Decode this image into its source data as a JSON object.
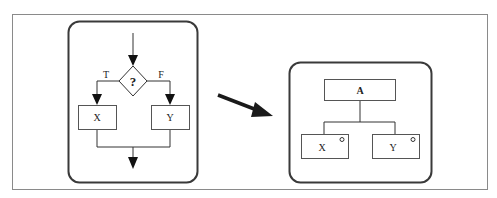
{
  "figure": {
    "colors": {
      "frame": "#8a8a8a",
      "panel_border": "#3a3a3a",
      "line": "#333333",
      "arrow": "#1a1a1a",
      "background": "#ffffff"
    },
    "left_panel": {
      "name": "flowchart",
      "decision_label": "?",
      "true_label": "T",
      "false_label": "F",
      "box_true_label": "X",
      "box_false_label": "Y"
    },
    "transform_arrow": "right-down-arrow",
    "right_panel": {
      "name": "structure-chart",
      "root_label": "A",
      "child_left_label": "X",
      "child_right_label": "Y",
      "child_marker": "selection-circle"
    }
  }
}
